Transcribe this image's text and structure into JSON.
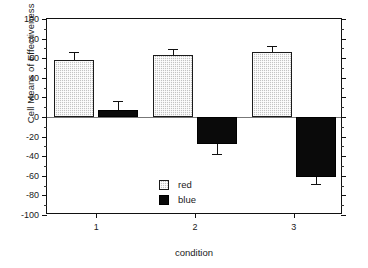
{
  "chart_data": {
    "type": "bar",
    "title": "",
    "xlabel": "condition",
    "ylabel": "Cell Means of Effectiveness Ratings",
    "categories": [
      "1",
      "2",
      "3"
    ],
    "ylim": [
      -100,
      100
    ],
    "ytick_step": 20,
    "yticks": [
      "100",
      "80",
      "60",
      "40",
      "20",
      "0",
      "-20",
      "-40",
      "-60",
      "-80",
      "-100"
    ],
    "ytick_values": [
      100,
      80,
      60,
      40,
      20,
      0,
      -20,
      -40,
      -60,
      -80,
      -100
    ],
    "yminor_step": 10,
    "grid": false,
    "legend_position": "inside-left-lower",
    "zero_reference_line": true,
    "series": [
      {
        "name": "red",
        "color": "#c3c3c3",
        "pattern": "stipple",
        "values": [
          58,
          63.5,
          66
        ],
        "errors_upper": [
          66,
          69,
          72
        ],
        "errors_lower": [
          58,
          63.5,
          66
        ]
      },
      {
        "name": "blue",
        "color": "#0a0a0a",
        "pattern": "solid",
        "values": [
          7,
          -28,
          -61
        ],
        "errors_upper": [
          16,
          -28,
          -61
        ],
        "errors_lower": [
          7,
          -38,
          -68
        ]
      }
    ],
    "legend": [
      {
        "label": "red"
      },
      {
        "label": "blue"
      }
    ]
  }
}
